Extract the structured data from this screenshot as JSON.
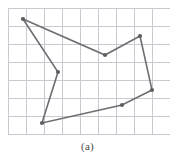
{
  "figure": {
    "caption": "(a)",
    "type": "polygon-on-grid"
  },
  "colors": {
    "background": "#ffffff",
    "grid_line": "#c9c9d2",
    "polygon_stroke": "#6e6e72",
    "vertex_marker": "#5d5d62",
    "caption_text": "#4a4a4a"
  },
  "grid": {
    "x_start": 8,
    "y_start": 8,
    "spacing": 18,
    "columns": 9,
    "rows": 7,
    "x_end": 170,
    "y_end": 134,
    "visible": true,
    "line_width": 1
  },
  "chart_data": {
    "type": "scatter",
    "title": "",
    "xlabel": "",
    "ylabel": "",
    "grid": true,
    "legend": null,
    "xlim": [
      8,
      170
    ],
    "ylim": [
      8,
      134
    ],
    "annotations": [
      "(a)"
    ],
    "series": [
      {
        "name": "polygon",
        "closed": true,
        "points": [
          {
            "label": "v1",
            "x": 23,
            "y": 19
          },
          {
            "label": "v2",
            "x": 105,
            "y": 55
          },
          {
            "label": "v3",
            "x": 140,
            "y": 36
          },
          {
            "label": "v4",
            "x": 152,
            "y": 90
          },
          {
            "label": "v5",
            "x": 122,
            "y": 105
          },
          {
            "label": "v6",
            "x": 42,
            "y": 123
          },
          {
            "label": "v7",
            "x": 58,
            "y": 72
          }
        ]
      }
    ]
  },
  "polygon": {
    "stroke_width": 1.6,
    "vertex_radius": 2.1,
    "vertex_count": 7
  }
}
